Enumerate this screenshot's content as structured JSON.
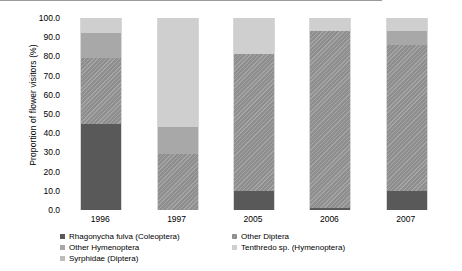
{
  "chart_data": {
    "type": "bar",
    "subtype": "stacked-100-percent",
    "title": "",
    "xlabel": "",
    "ylabel": "Proportion of flower visitors (%)",
    "ylim": [
      0,
      100
    ],
    "yticks": [
      "0.0",
      "10.0",
      "20.0",
      "30.0",
      "40.0",
      "50.0",
      "60.0",
      "70.0",
      "80.0",
      "90.0",
      "100.0"
    ],
    "ytick_values": [
      0,
      10,
      20,
      30,
      40,
      50,
      60,
      70,
      80,
      90,
      100
    ],
    "grid": false,
    "legend_position": "bottom",
    "categories": [
      "1996",
      "1997",
      "2005",
      "2006",
      "2007"
    ],
    "series": [
      {
        "name": "Rhagonycha fulva (Coleoptera)",
        "color": "#595959",
        "values": [
          45,
          0,
          10,
          1,
          10
        ]
      },
      {
        "name": "Other Diptera",
        "color": "#8e8e8e",
        "values": [
          34,
          29,
          71,
          92,
          76
        ]
      },
      {
        "name": "Other Hymenoptera",
        "color": "#a8a8a8",
        "values": [
          13,
          14,
          0,
          0,
          7
        ]
      },
      {
        "name": "Tenthredo sp. (Hymenoptera)",
        "color": "#cfcfcf",
        "values": [
          8,
          57,
          19,
          7,
          7
        ]
      },
      {
        "name": "Syrphidae (Diptera)",
        "color": "#bdbdbd",
        "values": [
          0,
          0,
          0,
          0,
          0
        ]
      }
    ],
    "stacks": [
      {
        "category": "1996",
        "segments": [
          {
            "name": "Tenthredo sp. (Hymenoptera)",
            "value": 8,
            "fill": "f-tenthredo"
          },
          {
            "name": "Other Hymenoptera",
            "value": 13,
            "fill": "f-otherhym"
          },
          {
            "name": "Other Diptera",
            "value": 34,
            "fill": "f-otherdiptera"
          },
          {
            "name": "Rhagonycha fulva (Coleoptera)",
            "value": 45,
            "fill": "f-rhagonycha"
          }
        ]
      },
      {
        "category": "1997",
        "segments": [
          {
            "name": "Tenthredo sp. (Hymenoptera)",
            "value": 57,
            "fill": "f-tenthredo"
          },
          {
            "name": "Other Hymenoptera",
            "value": 14,
            "fill": "f-otherhym"
          },
          {
            "name": "Other Diptera",
            "value": 29,
            "fill": "f-otherdiptera"
          }
        ]
      },
      {
        "category": "2005",
        "segments": [
          {
            "name": "Tenthredo sp. (Hymenoptera)",
            "value": 19,
            "fill": "f-tenthredo"
          },
          {
            "name": "Other Diptera",
            "value": 71,
            "fill": "f-otherdiptera"
          },
          {
            "name": "Rhagonycha fulva (Coleoptera)",
            "value": 10,
            "fill": "f-rhagonycha"
          }
        ]
      },
      {
        "category": "2006",
        "segments": [
          {
            "name": "Tenthredo sp. (Hymenoptera)",
            "value": 7,
            "fill": "f-tenthredo"
          },
          {
            "name": "Other Diptera",
            "value": 92,
            "fill": "f-otherdiptera"
          },
          {
            "name": "Rhagonycha fulva (Coleoptera)",
            "value": 1,
            "fill": "f-rhagonycha"
          }
        ]
      },
      {
        "category": "2007",
        "segments": [
          {
            "name": "Tenthredo sp. (Hymenoptera)",
            "value": 7,
            "fill": "f-tenthredo"
          },
          {
            "name": "Other Hymenoptera",
            "value": 7,
            "fill": "f-otherhym"
          },
          {
            "name": "Other Diptera",
            "value": 76,
            "fill": "f-otherdiptera"
          },
          {
            "name": "Rhagonycha fulva (Coleoptera)",
            "value": 10,
            "fill": "f-rhagonycha"
          }
        ]
      }
    ]
  },
  "legend": {
    "column1": [
      {
        "label": "Rhagonycha fulva (Coleoptera)",
        "fill": "f-rhagonycha"
      },
      {
        "label": "Other Hymenoptera",
        "fill": "f-otherhym"
      },
      {
        "label": "Syrphidae (Diptera)",
        "fill": "f-syrphidae"
      }
    ],
    "column2": [
      {
        "label": "Other Diptera",
        "fill": "f-otherdiptera"
      },
      {
        "label": "Tenthredo sp. (Hymenoptera)",
        "fill": "f-tenthredo"
      }
    ]
  }
}
